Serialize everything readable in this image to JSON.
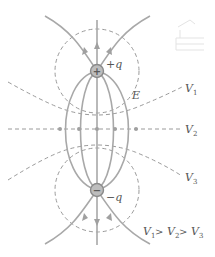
{
  "diagram": {
    "charges": [
      {
        "id": "positive",
        "label": "+q",
        "sign": "+"
      },
      {
        "id": "negative",
        "label": "−q",
        "sign": "−"
      }
    ],
    "field_label": "E",
    "equipotentials": [
      {
        "id": "v1",
        "letter": "V",
        "sub": "1"
      },
      {
        "id": "v2",
        "letter": "V",
        "sub": "2"
      },
      {
        "id": "v3",
        "letter": "V",
        "sub": "3"
      }
    ],
    "relation": {
      "parts": [
        "V",
        "1",
        " > ",
        "V",
        "2",
        " > ",
        "V",
        "3"
      ]
    },
    "colors": {
      "field_line": "#a8a8a8",
      "equipotential": "#9a9a9a",
      "charge_fill": "#bdbdbd",
      "text": "#555555"
    }
  }
}
